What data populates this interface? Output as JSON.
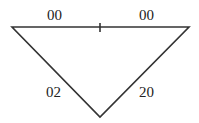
{
  "diagram": {
    "type": "triangle",
    "vertices": {
      "top_left": [
        12,
        27
      ],
      "top_right": [
        189,
        27
      ],
      "bottom": [
        100,
        117
      ]
    },
    "midpoint_tick": [
      100,
      27
    ],
    "labels": {
      "top_left_segment": "00",
      "top_right_segment": "00",
      "left_side": "02",
      "right_side": "20"
    },
    "stroke_color": "#333333"
  }
}
